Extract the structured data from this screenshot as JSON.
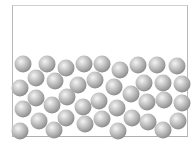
{
  "diagram": {
    "container": {
      "x": 12,
      "y": 5,
      "width": 176,
      "height": 132,
      "border_color": "#b8b8b8"
    },
    "particle": {
      "radius": 8.5,
      "colors": {
        "highlight": "#f4f4f4",
        "mid": "#bdbdbd",
        "shadow": "#8c8c8c"
      }
    },
    "particles": [
      {
        "x": 23,
        "y": 64
      },
      {
        "x": 47,
        "y": 64
      },
      {
        "x": 66,
        "y": 68
      },
      {
        "x": 84,
        "y": 64
      },
      {
        "x": 102,
        "y": 64
      },
      {
        "x": 120,
        "y": 70
      },
      {
        "x": 138,
        "y": 65
      },
      {
        "x": 157,
        "y": 65
      },
      {
        "x": 177,
        "y": 66
      },
      {
        "x": 36,
        "y": 78
      },
      {
        "x": 55,
        "y": 81
      },
      {
        "x": 78,
        "y": 85
      },
      {
        "x": 95,
        "y": 80
      },
      {
        "x": 114,
        "y": 87
      },
      {
        "x": 144,
        "y": 83
      },
      {
        "x": 163,
        "y": 83
      },
      {
        "x": 182,
        "y": 84
      },
      {
        "x": 20,
        "y": 88
      },
      {
        "x": 36,
        "y": 98
      },
      {
        "x": 52,
        "y": 105
      },
      {
        "x": 67,
        "y": 97
      },
      {
        "x": 83,
        "y": 107
      },
      {
        "x": 99,
        "y": 101
      },
      {
        "x": 117,
        "y": 108
      },
      {
        "x": 131,
        "y": 94
      },
      {
        "x": 147,
        "y": 102
      },
      {
        "x": 164,
        "y": 100
      },
      {
        "x": 182,
        "y": 103
      },
      {
        "x": 23,
        "y": 109
      },
      {
        "x": 39,
        "y": 121
      },
      {
        "x": 66,
        "y": 118
      },
      {
        "x": 85,
        "y": 124
      },
      {
        "x": 102,
        "y": 119
      },
      {
        "x": 132,
        "y": 118
      },
      {
        "x": 148,
        "y": 122
      },
      {
        "x": 178,
        "y": 121
      },
      {
        "x": 20,
        "y": 131
      },
      {
        "x": 54,
        "y": 130
      },
      {
        "x": 118,
        "y": 131
      },
      {
        "x": 163,
        "y": 130
      }
    ]
  }
}
